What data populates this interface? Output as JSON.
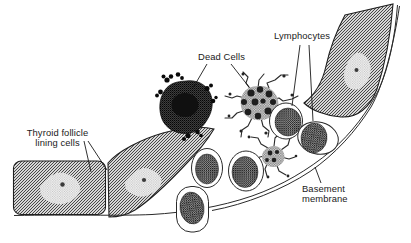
{
  "figure": {
    "type": "medical-line-illustration",
    "palette": {
      "paper": "#ffffff",
      "ink": "#1a1a1a",
      "follicle_cell_gray": "#d9d9d9",
      "lymphocyte_nucleus_gray": "#9b9b9b",
      "dead_cell_dark": "#4a4a4a"
    },
    "labels": {
      "dead_cells": "Dead Cells",
      "lymphocytes": "Lymphocytes",
      "thyroid_follicle_line1": "Thyroid follicle",
      "thyroid_follicle_line2": "lining cells",
      "basement_membrane_line1": "Basement",
      "basement_membrane_line2": "membrane"
    }
  }
}
